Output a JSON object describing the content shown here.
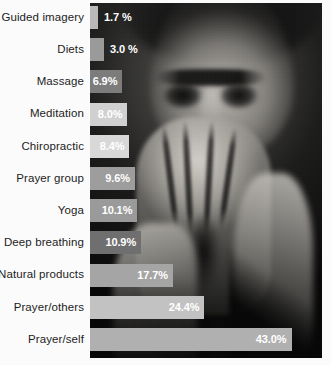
{
  "chart_data": {
    "type": "bar",
    "orientation": "horizontal",
    "title": "",
    "xlabel": "",
    "ylabel": "",
    "xlim": [
      0,
      49.5
    ],
    "grid": false,
    "legend": null,
    "value_suffix": "%",
    "categories": [
      "Guided imagery",
      "Diets",
      "Massage",
      "Meditation",
      "Chiropractic",
      "Prayer group",
      "Yoga",
      "Deep breathing",
      "Natural products",
      "Prayer/others",
      "Prayer/self"
    ],
    "values": [
      1.7,
      3.0,
      6.9,
      8.0,
      8.4,
      9.6,
      10.1,
      10.9,
      17.7,
      24.4,
      43.0
    ],
    "value_labels": [
      "1.7 %",
      "3.0 %",
      "6.9%",
      "8.0%",
      "8.4%",
      "9.6%",
      "10.1%",
      "10.9%",
      "17.7%",
      "24.4%",
      "43.0%"
    ],
    "bar_colors": [
      "#b9b9b9",
      "#9a9a9a",
      "#7c7c7c",
      "#d0d0d0",
      "#d8d8d8",
      "#9d9d9d",
      "#9a9a9a",
      "#6f6f6f",
      "#a5a5a5",
      "#c2c2c2",
      "#b0b0b0"
    ],
    "label_inside": [
      false,
      false,
      true,
      true,
      true,
      true,
      true,
      true,
      true,
      true,
      true
    ]
  },
  "colors": {
    "background": "#ffffff",
    "label_text": "#1d1d1d",
    "value_text": "#ffffff",
    "photo_backdrop": "#0a0a0a"
  },
  "photo": {
    "alt": "black and white photo of a person with hands clasped in prayer"
  }
}
